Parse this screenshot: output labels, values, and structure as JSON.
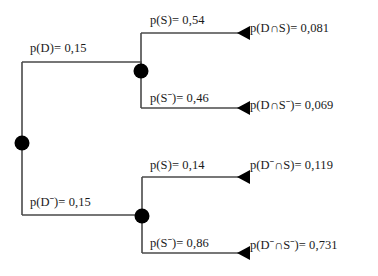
{
  "diagram": {
    "type": "probability-tree",
    "title": "",
    "colors": {
      "line": "#4a4a4a",
      "node": "#000000",
      "arrow": "#000000",
      "text": "#1a1a1a",
      "background": "#ffffff"
    },
    "root": {
      "label": ""
    },
    "level1": [
      {
        "id": "branch-d",
        "event": "D",
        "label": "p(D)= 0,15",
        "probability": 0.15
      },
      {
        "id": "branch-d-not",
        "event": "D¯",
        "label": "p(Dˉ)= 0,15",
        "probability": 0.15
      }
    ],
    "level2": [
      {
        "id": "branch-d-s",
        "parent": "branch-d",
        "event": "S",
        "label": "p(S)= 0,54",
        "probability": 0.54
      },
      {
        "id": "branch-d-s-not",
        "parent": "branch-d",
        "event": "S¯",
        "label": "p(Sˉ)= 0,46",
        "probability": 0.46
      },
      {
        "id": "branch-dn-s",
        "parent": "branch-d-not",
        "event": "S",
        "label": "p(S)= 0,14",
        "probability": 0.14
      },
      {
        "id": "branch-dn-s-not",
        "parent": "branch-d-not",
        "event": "S¯",
        "label": "p(Sˉ)= 0,86",
        "probability": 0.86
      }
    ],
    "outcomes": [
      {
        "id": "outcome-ds",
        "label": "p(D∩S)= 0,081",
        "value": 0.081
      },
      {
        "id": "outcome-dsn",
        "label": "p(D∩Sˉ)= 0,069",
        "value": 0.069
      },
      {
        "id": "outcome-dns",
        "label": "p(Dˉ∩S)= 0,119",
        "value": 0.119
      },
      {
        "id": "outcome-dnsn",
        "label": "p(Dˉ∩Sˉ)= 0,731",
        "value": 0.731
      }
    ]
  }
}
